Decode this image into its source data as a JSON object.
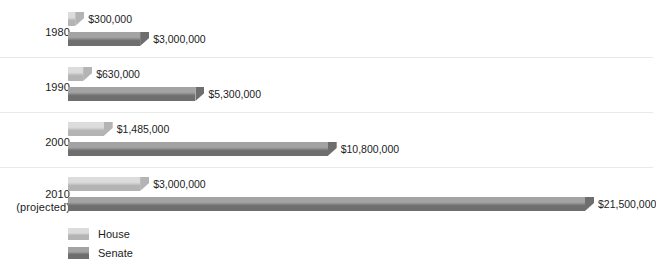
{
  "chart_data": {
    "type": "bar",
    "orientation": "horizontal",
    "title": "",
    "xlabel": "",
    "ylabel": "",
    "categories": [
      "1980",
      "1990",
      "2000",
      "2010\n(projected)"
    ],
    "category_labels": [
      {
        "line1": "1980",
        "line2": ""
      },
      {
        "line1": "1990",
        "line2": ""
      },
      {
        "line1": "2000",
        "line2": ""
      },
      {
        "line1": "2010",
        "line2": "(projected)"
      }
    ],
    "series": [
      {
        "name": "House",
        "color": "#c9c9c9",
        "values": [
          300000,
          630000,
          1485000,
          3000000
        ],
        "value_labels": [
          "$300,000",
          "$630,000",
          "$1,485,000",
          "$3,000,000"
        ]
      },
      {
        "name": "Senate",
        "color": "#8e8e8e",
        "values": [
          3000000,
          5300000,
          10800000,
          21500000
        ],
        "value_labels": [
          "$3,000,000",
          "$5,300,000",
          "$10,800,000",
          "$21,500,000"
        ]
      }
    ],
    "xlim": [
      0,
      21500000
    ],
    "grid": false,
    "legend_position": "bottom-left",
    "legend_entries": [
      "House",
      "Senate"
    ]
  },
  "legend": {
    "house": "House",
    "senate": "Senate"
  },
  "colors": {
    "house_light": "#dcdcdc",
    "house_dark": "#b4b4b4",
    "senate_light": "#a3a3a3",
    "senate_dark": "#6e6e6e",
    "background": "#ffffff",
    "separator": "#e8e8e8",
    "text": "#1c1c1c"
  }
}
